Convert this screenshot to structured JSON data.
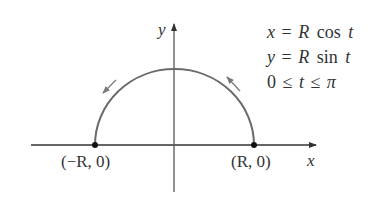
{
  "diagram": {
    "colors": {
      "axis": "#333333",
      "curve": "#6a6a6a",
      "text": "#333333",
      "arrow": "#7a7a7a"
    },
    "axes": {
      "x_label": "x",
      "y_label": "y"
    },
    "points": {
      "left": {
        "label": "(−R, 0)"
      },
      "right": {
        "label": "(R, 0)"
      }
    },
    "equations": {
      "line1": {
        "lhs": "x",
        "eq": "=",
        "var": "R",
        "fn": "cos",
        "arg": "t"
      },
      "line2": {
        "lhs": "y",
        "eq": "=",
        "var": "R",
        "fn": "sin",
        "arg": "t"
      },
      "line3": {
        "lo": "0",
        "le1": "≤",
        "var": "t",
        "le2": "≤",
        "hi": "π"
      }
    },
    "direction": "counterclockwise from (R, 0) to (−R, 0)"
  }
}
